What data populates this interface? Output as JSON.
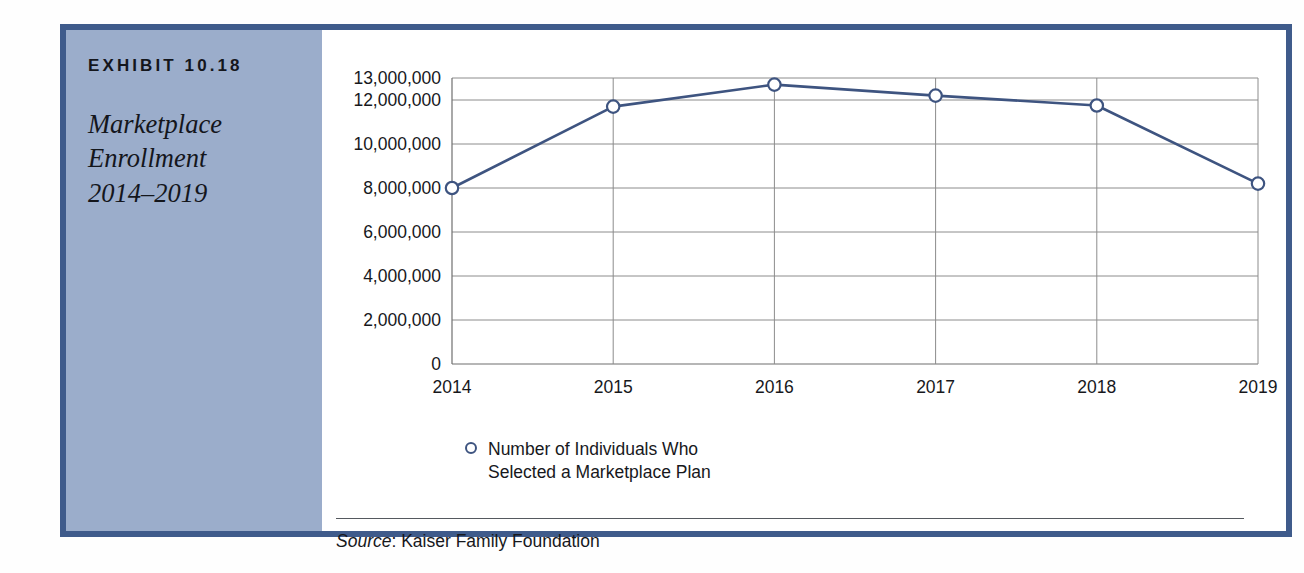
{
  "exhibit": {
    "number_label": "EXHIBIT 10.18",
    "title_lines": [
      "Marketplace",
      "Enrollment",
      "2014–2019"
    ],
    "border_color": "#3f5b8b",
    "sidebar_color": "#9badcb"
  },
  "source": {
    "prefix": "Source",
    "separator": ": ",
    "text": "Kaiser Family Foundation"
  },
  "legend": {
    "marker_shape": "open-circle",
    "line1": "Number of Individuals Who",
    "line2": "Selected a Marketplace Plan"
  },
  "chart_data": {
    "type": "line",
    "title": "Marketplace Enrollment 2014–2019",
    "xlabel": "",
    "ylabel": "",
    "categories": [
      "2014",
      "2015",
      "2016",
      "2017",
      "2018",
      "2019"
    ],
    "series": [
      {
        "name": "Number of Individuals Who Selected a Marketplace Plan",
        "color": "#3e5480",
        "marker": "open-circle",
        "values": [
          8000000,
          11700000,
          12700000,
          12200000,
          11750000,
          8200000
        ]
      }
    ],
    "ylim": [
      0,
      13000000
    ],
    "yticks": [
      0,
      2000000,
      4000000,
      6000000,
      8000000,
      10000000,
      12000000,
      13000000
    ],
    "ytick_labels": [
      "0",
      "2,000,000",
      "4,000,000",
      "6,000,000",
      "8,000,000",
      "10,000,000",
      "12,000,000",
      "13,000,000"
    ],
    "grid": true,
    "grid_vertical": true,
    "legend_position": "below-left"
  }
}
